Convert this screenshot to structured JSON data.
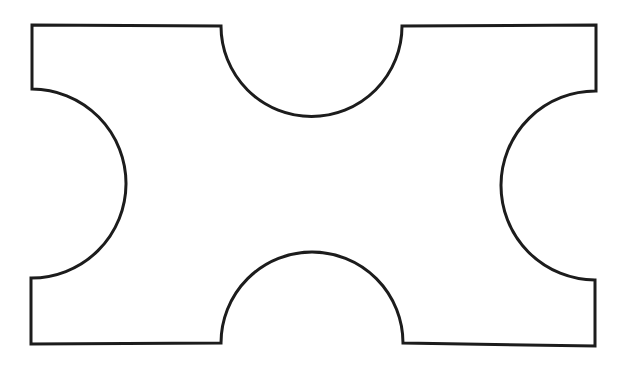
{
  "image": {
    "kind": "line-drawing",
    "description": "Black outline geometric figure on white background",
    "width": 631,
    "height": 370,
    "background_color": "#ffffff",
    "stroke_color": "#1c1c1c",
    "stroke_width": 3,
    "fill_color": "#ffffff",
    "caption": ""
  },
  "figure": {
    "name": "concave-octagonal-plate",
    "bounding_box": {
      "left": 32,
      "top": 25,
      "right": 596,
      "bottom": 345
    },
    "notches": [
      {
        "name": "top-notch",
        "side": "top",
        "start": {
          "x": 221,
          "y": 26
        },
        "end": {
          "x": 402,
          "y": 26
        },
        "apex": {
          "x": 311,
          "y": 120
        },
        "radius": 90.5,
        "sweep": "concave-downward"
      },
      {
        "name": "bottom-notch",
        "side": "bottom",
        "start": {
          "x": 403,
          "y": 343
        },
        "end": {
          "x": 221,
          "y": 343
        },
        "apex": {
          "x": 312,
          "y": 249
        },
        "radius": 91,
        "sweep": "concave-upward"
      },
      {
        "name": "left-notch",
        "side": "left",
        "start": {
          "x": 32,
          "y": 278
        },
        "end": {
          "x": 32,
          "y": 89
        },
        "apex": {
          "x": 119,
          "y": 184
        },
        "radius": 94.5,
        "sweep": "concave-rightward"
      },
      {
        "name": "right-notch",
        "side": "right",
        "start": {
          "x": 596,
          "y": 91
        },
        "end": {
          "x": 595,
          "y": 280
        },
        "apex": {
          "x": 497,
          "y": 185
        },
        "radius": 94.5,
        "sweep": "concave-leftward"
      }
    ],
    "path_d": "M 32 25 L 221 26 A 90.5 90.5 0 0 0 402 26 L 596 25 L 596 91 A 94.5 94.5 0 0 0 595 280 L 595 346 L 403 343 A 91 91 0 0 0 221 343 L 31 344 L 31 278 A 94.5 94.5 0 0 0 32 89 Z"
  }
}
